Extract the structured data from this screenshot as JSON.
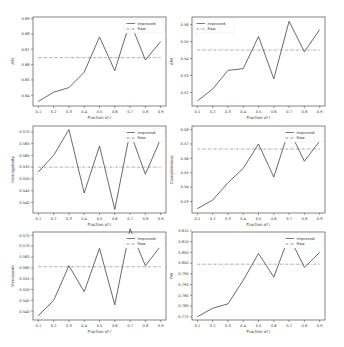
{
  "figure": {
    "layout": "3 rows x 2 columns",
    "legend_labels": {
      "improved": "Improved",
      "raw": "Raw"
    }
  },
  "chart_data": [
    {
      "type": "line",
      "position": "row1-col1",
      "xlabel": "Fraction of r",
      "ylabel": "ARI",
      "x": [
        0.1,
        0.2,
        0.3,
        0.4,
        0.5,
        0.6,
        0.7,
        0.8,
        0.9
      ],
      "x_tick_labels": [
        "0.1",
        "0.2",
        "0.3",
        "0.4",
        "0.5",
        "0.6",
        "0.7",
        "0.8",
        "0.9"
      ],
      "ylim": [
        0.633,
        0.691
      ],
      "y_ticks": [
        0.64,
        0.65,
        0.66,
        0.67,
        0.68,
        0.69
      ],
      "y_tick_labels": [
        "0.64",
        "0.65",
        "0.66",
        "0.67",
        "0.68",
        "0.69"
      ],
      "legend_position": "upper right",
      "series": [
        {
          "name": "Improved",
          "style": "solid",
          "values": [
            0.636,
            0.642,
            0.645,
            0.655,
            0.678,
            0.656,
            0.688,
            0.663,
            0.675
          ]
        },
        {
          "name": "Raw",
          "style": "dashed",
          "values": [
            0.6645,
            0.6645,
            0.6645,
            0.6645,
            0.6645,
            0.6645,
            0.6645,
            0.6645,
            0.6645
          ]
        }
      ]
    },
    {
      "type": "line",
      "position": "row1-col2",
      "xlabel": "Fraction of r",
      "ylabel": "AMI",
      "x": [
        0.1,
        0.2,
        0.3,
        0.4,
        0.5,
        0.6,
        0.7,
        0.8,
        0.9
      ],
      "x_tick_labels": [
        "0.1",
        "0.2",
        "0.3",
        "0.4",
        "0.5",
        "0.6",
        "0.7",
        "0.8",
        "0.9"
      ],
      "ylim": [
        0.512,
        0.5645
      ],
      "y_ticks": [
        0.52,
        0.53,
        0.54,
        0.55,
        0.56
      ],
      "y_tick_labels": [
        "0.52",
        "0.53",
        "0.54",
        "0.55",
        "0.56"
      ],
      "legend_position": "upper left",
      "series": [
        {
          "name": "Improved",
          "style": "solid",
          "values": [
            0.515,
            0.522,
            0.533,
            0.534,
            0.553,
            0.528,
            0.562,
            0.544,
            0.557
          ]
        },
        {
          "name": "Raw",
          "style": "dashed",
          "values": [
            0.545,
            0.545,
            0.545,
            0.545,
            0.545,
            0.545,
            0.545,
            0.545,
            0.545
          ]
        }
      ]
    },
    {
      "type": "line",
      "position": "row2-col1",
      "xlabel": "Fraction of r",
      "ylabel": "Homogeneity",
      "x": [
        0.1,
        0.2,
        0.3,
        0.4,
        0.5,
        0.6,
        0.7,
        0.8,
        0.9
      ],
      "x_tick_labels": [
        "0.1",
        "0.2",
        "0.3",
        "0.4",
        "0.5",
        "0.6",
        "0.7",
        "0.8",
        "0.9"
      ],
      "ylim": [
        0.5355,
        0.5725
      ],
      "y_ticks": [
        0.54,
        0.545,
        0.55,
        0.555,
        0.56,
        0.565,
        0.57
      ],
      "y_tick_labels": [
        "0.540",
        "0.545",
        "0.550",
        "0.555",
        "0.560",
        "0.565",
        "0.570"
      ],
      "legend_position": "upper right",
      "series": [
        {
          "name": "Improved",
          "style": "solid",
          "values": [
            0.553,
            0.56,
            0.571,
            0.544,
            0.564,
            0.537,
            0.57,
            0.552,
            0.567
          ]
        },
        {
          "name": "Raw",
          "style": "dashed",
          "values": [
            0.555,
            0.555,
            0.555,
            0.555,
            0.555,
            0.555,
            0.555,
            0.555,
            0.555
          ]
        }
      ]
    },
    {
      "type": "line",
      "position": "row2-col2",
      "xlabel": "Fraction of r",
      "ylabel": "Completeness",
      "x": [
        0.1,
        0.2,
        0.3,
        0.4,
        0.5,
        0.6,
        0.7,
        0.8,
        0.9
      ],
      "x_tick_labels": [
        "0.1",
        "0.2",
        "0.3",
        "0.4",
        "0.5",
        "0.6",
        "0.7",
        "0.8",
        "0.9"
      ],
      "ylim": [
        0.522,
        0.5825
      ],
      "y_ticks": [
        0.53,
        0.54,
        0.55,
        0.56,
        0.57,
        0.58
      ],
      "y_tick_labels": [
        "0.53",
        "0.54",
        "0.55",
        "0.56",
        "0.57",
        "0.58"
      ],
      "legend_position": "upper right",
      "series": [
        {
          "name": "Improved",
          "style": "solid",
          "values": [
            0.525,
            0.531,
            0.543,
            0.553,
            0.57,
            0.547,
            0.58,
            0.558,
            0.572
          ]
        },
        {
          "name": "Raw",
          "style": "dashed",
          "values": [
            0.5665,
            0.5665,
            0.5665,
            0.5665,
            0.5665,
            0.5665,
            0.5665,
            0.5665,
            0.5665
          ]
        }
      ]
    },
    {
      "type": "line",
      "position": "row3-col1",
      "xlabel": "Fraction of r",
      "ylabel": "V-measure",
      "x": [
        0.1,
        0.2,
        0.3,
        0.4,
        0.5,
        0.6,
        0.7,
        0.8,
        0.9
      ],
      "x_tick_labels": [
        "0.1",
        "0.2",
        "0.3",
        "0.4",
        "0.5",
        "0.6",
        "0.7",
        "0.8",
        "0.9"
      ],
      "ylim": [
        0.536,
        0.5765
      ],
      "y_ticks": [
        0.54,
        0.545,
        0.55,
        0.555,
        0.56,
        0.565,
        0.57,
        0.575
      ],
      "y_tick_labels": [
        "0.540",
        "0.545",
        "0.550",
        "0.555",
        "0.560",
        "0.565",
        "0.570",
        "0.575"
      ],
      "legend_position": "upper right",
      "series": [
        {
          "name": "Improved",
          "style": "solid",
          "values": [
            0.538,
            0.545,
            0.561,
            0.549,
            0.569,
            0.543,
            0.578,
            0.561,
            0.57
          ]
        },
        {
          "name": "Raw",
          "style": "dashed",
          "values": [
            0.5605,
            0.5605,
            0.5605,
            0.5605,
            0.5605,
            0.5605,
            0.5605,
            0.5605,
            0.5605
          ]
        }
      ]
    },
    {
      "type": "line",
      "position": "row3-col2",
      "xlabel": "Fraction of r",
      "ylabel": "FMI",
      "x": [
        0.1,
        0.2,
        0.3,
        0.4,
        0.5,
        0.6,
        0.7,
        0.8,
        0.9
      ],
      "x_tick_labels": [
        "0.1",
        "0.2",
        "0.3",
        "0.4",
        "0.5",
        "0.6",
        "0.7",
        "0.8",
        "0.9"
      ],
      "ylim": [
        0.7735,
        0.8145
      ],
      "y_ticks": [
        0.775,
        0.78,
        0.785,
        0.79,
        0.795,
        0.8,
        0.805,
        0.81,
        0.815
      ],
      "y_tick_labels": [
        "0.775",
        "0.780",
        "0.785",
        "0.790",
        "0.795",
        "0.800",
        "0.805",
        "0.810",
        "0.815"
      ],
      "legend_position": "upper right",
      "series": [
        {
          "name": "Improved",
          "style": "solid",
          "values": [
            0.775,
            0.779,
            0.781,
            0.792,
            0.8045,
            0.7935,
            0.8125,
            0.798,
            0.805
          ]
        },
        {
          "name": "Raw",
          "style": "dashed",
          "values": [
            0.7995,
            0.7995,
            0.7995,
            0.7995,
            0.7995,
            0.7995,
            0.7995,
            0.7995,
            0.7995
          ]
        }
      ]
    }
  ],
  "style": {
    "line_color": "#444444",
    "raw_color": "#666666",
    "axis_color": "#333333",
    "background": "#ffffff"
  }
}
